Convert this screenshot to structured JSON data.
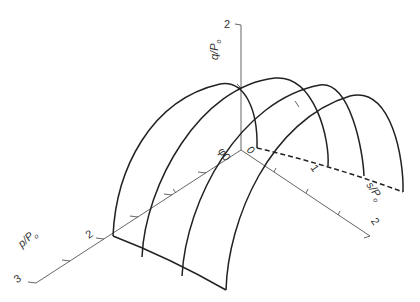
{
  "figure": {
    "axes": {
      "q": {
        "label": "q/P",
        "subscript": "o",
        "ticks": [
          "1",
          "2"
        ]
      },
      "p": {
        "label": "p/P",
        "subscript": "o",
        "ticks": [
          "1",
          "2",
          "3"
        ]
      },
      "s": {
        "label": "s/P",
        "subscript": "o",
        "ticks": [
          "1",
          "2"
        ]
      }
    },
    "origin_labels": {
      "phi": "φ0",
      "zero": "0"
    },
    "tick_labels": {
      "q_top": "2",
      "p_2": "2",
      "p_3": "3",
      "s_1": "1",
      "s_2": "2",
      "p_1": "1",
      "q_1_front": "1",
      "q_1_back": "1"
    },
    "colors": {
      "line": "#222222",
      "axis": "#555555",
      "background": "#ffffff"
    }
  }
}
